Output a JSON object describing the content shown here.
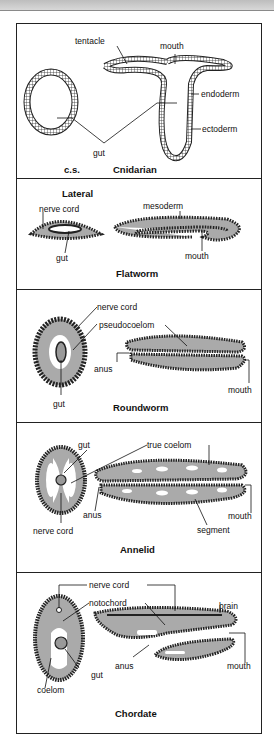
{
  "figure": {
    "panels": [
      {
        "title": "Cnidarian",
        "subtitle": "c.s.",
        "labels": {
          "tentacle": "tentacle",
          "mouth": "mouth",
          "endoderm": "endoderm",
          "ectoderm": "ectoderm",
          "gut": "gut"
        }
      },
      {
        "title": "Flatworm",
        "subtitle": "Lateral",
        "labels": {
          "nerve_cord": "nerve cord",
          "mesoderm": "mesoderm",
          "gut": "gut",
          "mouth": "mouth"
        }
      },
      {
        "title": "Roundworm",
        "labels": {
          "nerve_cord": "nerve cord",
          "pseudocoelom": "pseudocoelom",
          "anus": "anus",
          "gut": "gut",
          "mouth": "mouth"
        }
      },
      {
        "title": "Annelid",
        "labels": {
          "gut": "gut",
          "true_coelom": "true coelom",
          "anus": "anus",
          "nerve_cord": "nerve cord",
          "mouth": "mouth",
          "segment": "segment"
        }
      },
      {
        "title": "Chordate",
        "labels": {
          "nerve_cord": "nerve cord",
          "notochord": "notochord",
          "brain": "brain",
          "anus": "anus",
          "mouth": "mouth",
          "gut": "gut",
          "coelom": "coelom"
        }
      }
    ]
  }
}
